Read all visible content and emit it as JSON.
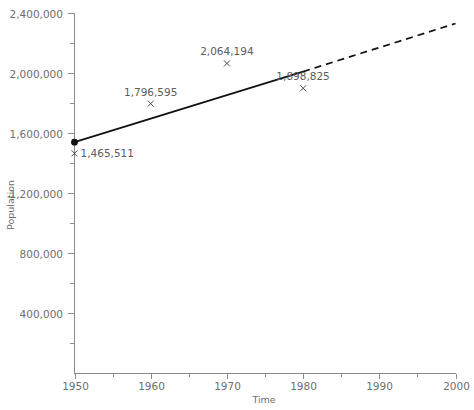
{
  "chart_data": {
    "type": "scatter",
    "title": "",
    "xlabel": "Time",
    "ylabel": "Population",
    "xlim": [
      1950,
      2000
    ],
    "ylim": [
      0,
      2400000
    ],
    "grid": false,
    "legend": "none",
    "x_ticks": [
      1950,
      1960,
      1970,
      1980,
      1990,
      2000
    ],
    "x_tick_labels": [
      "1950",
      "1960",
      "1970",
      "1980",
      "1990",
      "2000"
    ],
    "x_minor_interval": 5,
    "y_ticks": [
      400000,
      800000,
      1200000,
      1600000,
      2000000,
      2400000
    ],
    "y_tick_labels": [
      "400,000",
      "800,000",
      "1,200,000",
      "1,600,000",
      "2,000,000",
      "2,400,000"
    ],
    "y_minor_interval": 200000,
    "points": [
      {
        "x": 1950,
        "y": 1465511,
        "label": "1,465,511",
        "label_pos": "right"
      },
      {
        "x": 1960,
        "y": 1796595,
        "label": "1,796,595",
        "label_pos": "above"
      },
      {
        "x": 1970,
        "y": 2064194,
        "label": "2,064,194",
        "label_pos": "above"
      },
      {
        "x": 1980,
        "y": 1898825,
        "label": "1,898,825",
        "label_pos": "above"
      }
    ],
    "series": [
      {
        "name": "fitted-trend",
        "style": "solid",
        "x": [
          1950,
          1980
        ],
        "y": [
          1540000,
          2010000
        ]
      },
      {
        "name": "extrapolated-trend",
        "style": "dashed",
        "x": [
          1980,
          2000
        ],
        "y": [
          2010000,
          2330000
        ]
      }
    ],
    "origin_marker": {
      "x": 1950,
      "y": 1540000,
      "style": "filled-circle"
    },
    "colors": {
      "trend": "#111111",
      "axis": "#8a8a8a",
      "text": "#6e6e6e",
      "marker": "#3a3a3a",
      "background": "#ffffff"
    }
  }
}
